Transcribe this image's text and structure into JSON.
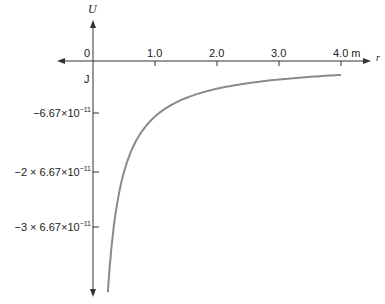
{
  "chart_data": {
    "type": "line",
    "title": "",
    "xlabel": "r",
    "ylabel": "U",
    "y_unit": "J",
    "x_unit": "m",
    "x_ticks": [
      "0",
      "1.0",
      "2.0",
      "3.0",
      "4.0 m"
    ],
    "y_ticks": [
      {
        "value": -6.67e-11,
        "label": "−6.67×10",
        "exp": "−11"
      },
      {
        "value": -1.334e-10,
        "label": "−2 × 6.67×10",
        "exp": "−11"
      },
      {
        "value": -2.001e-10,
        "label": "−3 × 6.67×10",
        "exp": "−11"
      }
    ],
    "xlim": [
      0,
      4.0
    ],
    "ylim_in_units_of_6.67e-11": [
      -4.2,
      0
    ],
    "grid": false,
    "legend": null,
    "series": [
      {
        "name": "U(r) = -G m1 m2 / r",
        "color": "#8a8a8a",
        "x": [
          0.24,
          0.3,
          0.4,
          0.5,
          0.6,
          0.75,
          1.0,
          1.25,
          1.5,
          2.0,
          2.5,
          3.0,
          3.5,
          4.0
        ],
        "y_in_units_of_6.67e-11": [
          -4.17,
          -3.33,
          -2.5,
          -2.0,
          -1.67,
          -1.33,
          -1.0,
          -0.8,
          -0.67,
          -0.5,
          -0.4,
          -0.33,
          -0.29,
          -0.25
        ]
      }
    ]
  },
  "labels": {
    "y_axis": "U",
    "x_axis": "r",
    "y_unit": "J",
    "origin": "0",
    "x_tick_1": "1.0",
    "x_tick_2": "2.0",
    "x_tick_3": "3.0",
    "x_tick_4": "4.0 m",
    "y_tick_1_base": "−6.67×10",
    "y_tick_2_base": "−2 × 6.67×10",
    "y_tick_3_base": "−3 × 6.67×10",
    "y_tick_exp": "−11"
  }
}
